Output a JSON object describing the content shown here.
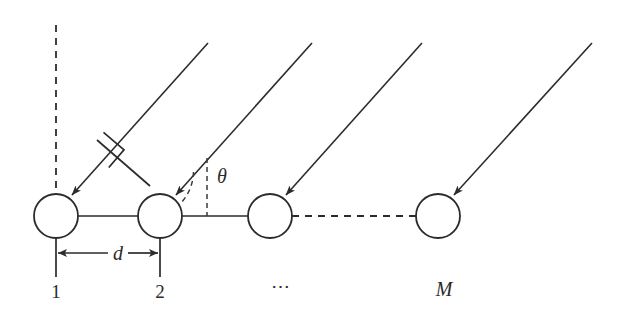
{
  "figure": {
    "type": "uniform-linear-array-geometry-diagram",
    "background_color": "#ffffff",
    "ink_color": "#2b2b2b",
    "width": 623,
    "height": 325
  },
  "labels": {
    "element_1": "1",
    "element_2": "2",
    "element_ellipsis": "⋯",
    "element_M": "M",
    "spacing": "d",
    "angle": "θ"
  },
  "elements": [
    {
      "name": "element-1",
      "label": "1",
      "cx": 56,
      "cy": 216,
      "r": 22
    },
    {
      "name": "element-2",
      "label": "2",
      "cx": 160,
      "cy": 216,
      "r": 22
    },
    {
      "name": "element-3",
      "label": "⋯",
      "cx": 270,
      "cy": 216,
      "r": 22
    },
    {
      "name": "element-M",
      "label": "M",
      "cx": 438,
      "cy": 216,
      "r": 22
    }
  ],
  "incident_rays": [
    {
      "name": "ray-to-element-1",
      "x1": 208,
      "y1": 43,
      "x2": 70,
      "y2": 197
    },
    {
      "name": "ray-to-element-2",
      "x1": 312,
      "y1": 43,
      "x2": 174,
      "y2": 197
    },
    {
      "name": "ray-to-element-3",
      "x1": 422,
      "y1": 43,
      "x2": 284,
      "y2": 197
    },
    {
      "name": "ray-to-element-M",
      "x1": 592,
      "y1": 43,
      "x2": 452,
      "y2": 197
    }
  ],
  "reference_lines": {
    "broadside_dashed_vertical": {
      "x": 56,
      "y_top": 25,
      "y_bottom": 196
    },
    "angle_dashed_vertical": {
      "x": 207,
      "y_top": 158,
      "y_bottom": 216
    }
  },
  "baseline": {
    "solid_from_x": 78,
    "solid_to_x": 248,
    "dashed_from_x": 292,
    "dashed_to_x": 416,
    "y": 216
  },
  "dimension": {
    "label": "d",
    "arrow_y": 253,
    "left_x": 56,
    "right_x": 160,
    "stem_bottom_y": 277
  },
  "angle_marker": {
    "label": "θ",
    "vertex_x": 160,
    "vertex_y": 216,
    "label_x": 222,
    "label_y": 177
  },
  "right_angle_marker": {
    "name": "perpendicular-wavefront-marker",
    "description": "square right-angle symbol between ray 1 and ray 2"
  },
  "tick_labels": {
    "label_y": 291,
    "items": [
      {
        "text": "1",
        "x": 56
      },
      {
        "text": "2",
        "x": 160
      },
      {
        "text": "⋯",
        "x": 281
      },
      {
        "text": "M",
        "x": 444
      }
    ]
  }
}
